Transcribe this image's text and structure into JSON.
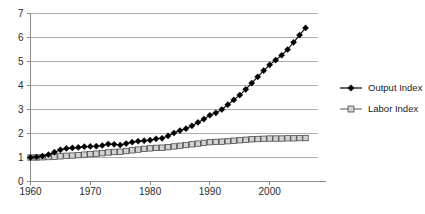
{
  "chart_data": {
    "type": "line",
    "title": "",
    "subtitle": "",
    "xlabel": "",
    "ylabel": "",
    "xlim": [
      1960,
      2008
    ],
    "ylim": [
      0,
      7
    ],
    "grid": true,
    "legend_position": "right",
    "x_ticks": [
      "1960",
      "1970",
      "1980",
      "1990",
      "2000"
    ],
    "x_tick_values": [
      1960,
      1970,
      1980,
      1990,
      2000
    ],
    "y_ticks": [
      "0",
      "1",
      "2",
      "3",
      "4",
      "5",
      "6",
      "7"
    ],
    "y_tick_values": [
      0,
      1,
      2,
      3,
      4,
      5,
      6,
      7
    ],
    "x": [
      1960,
      1961,
      1962,
      1963,
      1964,
      1965,
      1966,
      1967,
      1968,
      1969,
      1970,
      1971,
      1972,
      1973,
      1974,
      1975,
      1976,
      1977,
      1978,
      1979,
      1980,
      1981,
      1982,
      1983,
      1984,
      1985,
      1986,
      1987,
      1988,
      1989,
      1990,
      1991,
      1992,
      1993,
      1994,
      1995,
      1996,
      1997,
      1998,
      1999,
      2000,
      2001,
      2002,
      2003,
      2004,
      2005,
      2006
    ],
    "series": [
      {
        "name": "Output Index",
        "marker": "diamond",
        "color": "#000000",
        "values": [
          1.0,
          1.02,
          1.06,
          1.12,
          1.22,
          1.32,
          1.38,
          1.4,
          1.42,
          1.45,
          1.46,
          1.47,
          1.5,
          1.56,
          1.55,
          1.52,
          1.58,
          1.64,
          1.68,
          1.7,
          1.72,
          1.78,
          1.8,
          1.9,
          2.02,
          2.12,
          2.2,
          2.32,
          2.46,
          2.6,
          2.76,
          2.86,
          3.0,
          3.2,
          3.4,
          3.6,
          3.84,
          4.1,
          4.36,
          4.62,
          4.86,
          5.06,
          5.26,
          5.5,
          5.8,
          6.1,
          6.4
        ]
      },
      {
        "name": "Labor Index",
        "marker": "square",
        "color": "#d2d2d2",
        "values": [
          1.0,
          1.0,
          1.01,
          1.02,
          1.03,
          1.05,
          1.07,
          1.08,
          1.1,
          1.12,
          1.14,
          1.16,
          1.18,
          1.21,
          1.23,
          1.24,
          1.27,
          1.3,
          1.33,
          1.36,
          1.38,
          1.4,
          1.41,
          1.43,
          1.46,
          1.49,
          1.52,
          1.55,
          1.58,
          1.61,
          1.64,
          1.65,
          1.66,
          1.68,
          1.7,
          1.72,
          1.74,
          1.76,
          1.77,
          1.78,
          1.79,
          1.79,
          1.79,
          1.8,
          1.8,
          1.81,
          1.81
        ]
      }
    ],
    "legend": [
      {
        "label": "Output Index",
        "marker": "diamond"
      },
      {
        "label": "Labor Index",
        "marker": "square"
      }
    ]
  }
}
